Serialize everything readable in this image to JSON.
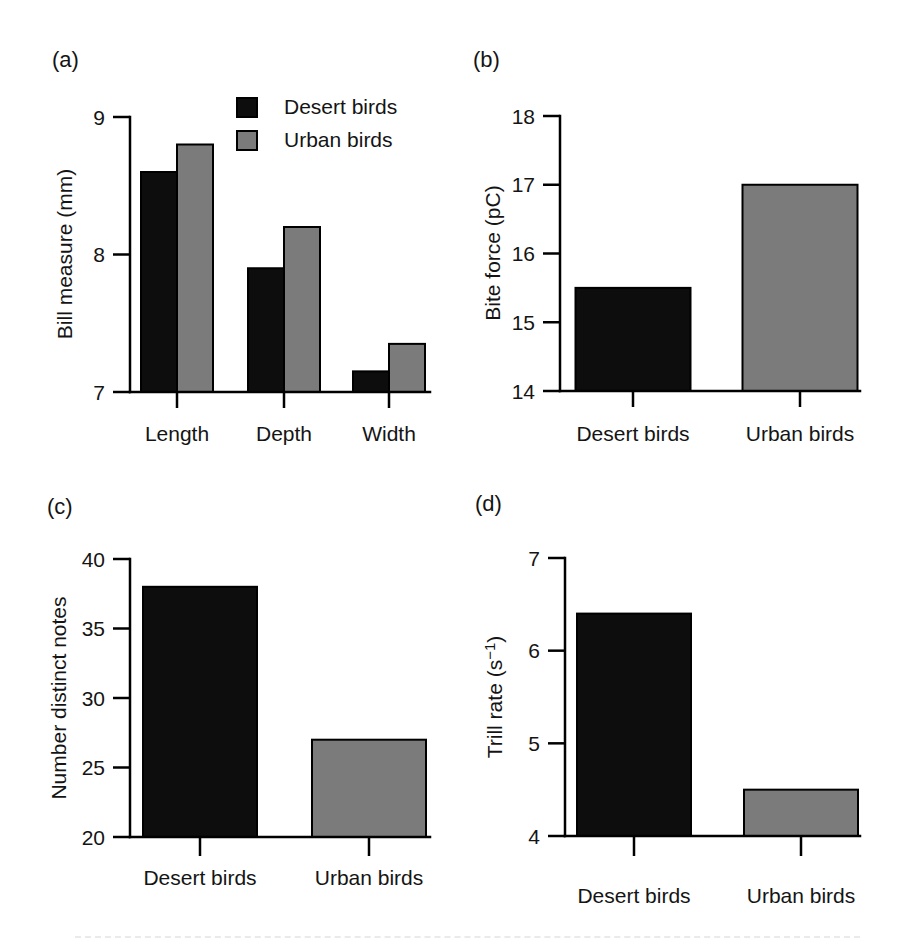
{
  "figure": {
    "background": "#ffffff",
    "text_color": "#141414",
    "axis_color": "#000000",
    "bar_border_color": "#000000",
    "series_legend": [
      "Desert birds",
      "Urban birds"
    ]
  },
  "chart_data": [
    {
      "type": "bar",
      "panel_label": "(a)",
      "ylabel": "Bill measure (mm)",
      "xlabel": "",
      "categories": [
        "Length",
        "Depth",
        "Width"
      ],
      "series": [
        {
          "name": "Desert birds",
          "color": "#0d0d0d",
          "values": [
            8.6,
            7.9,
            7.15
          ]
        },
        {
          "name": "Urban birds",
          "color": "#7b7b7b",
          "values": [
            8.8,
            8.2,
            7.35
          ]
        }
      ],
      "ylim": [
        7,
        9
      ],
      "yticks": [
        7,
        8,
        9
      ],
      "grid": false,
      "legend": {
        "position": "top-inside",
        "entries": [
          "Desert birds",
          "Urban birds"
        ]
      }
    },
    {
      "type": "bar",
      "panel_label": "(b)",
      "ylabel": "Bite force (pC)",
      "xlabel": "",
      "categories": [
        "Desert birds",
        "Urban birds"
      ],
      "values": [
        15.5,
        17.0
      ],
      "bar_colors": [
        "#0d0d0d",
        "#7b7b7b"
      ],
      "ylim": [
        14,
        18
      ],
      "yticks": [
        14,
        15,
        16,
        17,
        18
      ],
      "grid": false
    },
    {
      "type": "bar",
      "panel_label": "(c)",
      "ylabel": "Number distinct notes",
      "xlabel": "",
      "categories": [
        "Desert birds",
        "Urban birds"
      ],
      "values": [
        38,
        27
      ],
      "bar_colors": [
        "#0d0d0d",
        "#7b7b7b"
      ],
      "ylim": [
        20,
        40
      ],
      "yticks": [
        20,
        25,
        30,
        35,
        40
      ],
      "grid": false
    },
    {
      "type": "bar",
      "panel_label": "(d)",
      "ylabel": "Trill rate (s⁻¹)",
      "xlabel": "",
      "categories": [
        "Desert birds",
        "Urban birds"
      ],
      "values": [
        6.4,
        4.5
      ],
      "bar_colors": [
        "#0d0d0d",
        "#7b7b7b"
      ],
      "ylim": [
        4,
        7
      ],
      "yticks": [
        4,
        5,
        6,
        7
      ],
      "grid": false
    }
  ]
}
